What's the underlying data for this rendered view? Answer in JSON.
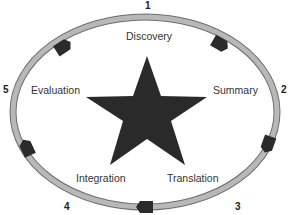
{
  "diagram": {
    "type": "cycle",
    "center_shape": "star",
    "colors": {
      "ring": "#b4b4b4",
      "ring_edge": "#6e6e6e",
      "marker": "#2b2b2b",
      "star": "#2a2a2a",
      "text": "#333333"
    },
    "stages": [
      {
        "number": "1",
        "label": "Discovery"
      },
      {
        "number": "2",
        "label": "Summary"
      },
      {
        "number": "3",
        "label": "Translation"
      },
      {
        "number": "4",
        "label": "Integration"
      },
      {
        "number": "5",
        "label": "Evaluation"
      }
    ]
  }
}
